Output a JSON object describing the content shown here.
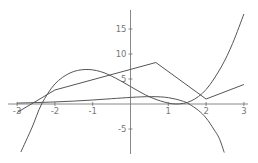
{
  "chart_data": {
    "type": "line",
    "title": "",
    "xlabel": "",
    "ylabel": "",
    "xlim": [
      -3.1,
      3.1
    ],
    "ylim": [
      -10,
      19
    ],
    "grid": false,
    "legend": null,
    "x_ticks": [
      {
        "value": -3,
        "label": "-3"
      },
      {
        "value": -2,
        "label": "-2"
      },
      {
        "value": -1,
        "label": "-1"
      },
      {
        "value": 1,
        "label": "1"
      },
      {
        "value": 2,
        "label": "2"
      },
      {
        "value": 3,
        "label": "3"
      }
    ],
    "y_ticks": [
      {
        "value": -5,
        "label": "-5"
      },
      {
        "value": 5,
        "label": "5"
      },
      {
        "value": 10,
        "label": "10"
      },
      {
        "value": 15,
        "label": "15"
      }
    ],
    "series": [
      {
        "name": "cubic",
        "kind": "smooth",
        "x": [
          -2.9,
          -2.6,
          -2.35,
          -2.0,
          -1.6,
          -1.2,
          -0.8,
          -0.4,
          0.0,
          0.4,
          0.8,
          1.2,
          1.6,
          2.0,
          2.4,
          2.7,
          3.0
        ],
        "y": [
          -9.6,
          -4.6,
          0.0,
          4.0,
          6.2,
          6.9,
          6.5,
          5.2,
          3.5,
          1.8,
          0.6,
          0.0,
          0.6,
          2.9,
          7.4,
          12.1,
          18.0
        ]
      },
      {
        "name": "piecewise-linear",
        "kind": "polyline",
        "x": [
          -3.0,
          -2.0,
          0.67,
          2.0,
          3.0
        ],
        "y": [
          -1.7,
          2.8,
          8.3,
          1.0,
          3.9
        ]
      },
      {
        "name": "exponential-type",
        "kind": "smooth",
        "x": [
          -3.0,
          -2.5,
          -2.0,
          -1.5,
          -1.0,
          -0.5,
          0.0,
          0.3,
          0.55,
          0.8,
          1.0,
          1.2,
          1.4,
          1.55,
          1.8,
          2.0,
          2.2,
          2.35,
          2.48
        ],
        "y": [
          0.19,
          0.28,
          0.41,
          0.58,
          0.8,
          1.06,
          1.32,
          1.43,
          1.47,
          1.42,
          1.27,
          0.97,
          0.52,
          0.0,
          -1.3,
          -2.8,
          -5.0,
          -6.9,
          -9.7
        ]
      }
    ]
  },
  "plot_area": {
    "x_origin_px": 130.5,
    "y_origin_px": 104,
    "px_per_x_unit": 37.8,
    "px_per_y_unit": 5.0,
    "x_axis_from_px": 8,
    "x_axis_to_px": 248,
    "y_axis_from_px": 10,
    "y_axis_to_px": 154
  }
}
